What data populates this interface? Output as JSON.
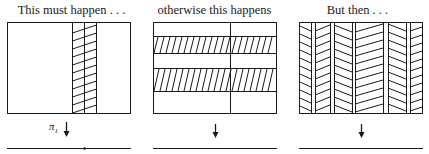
{
  "panels": [
    {
      "caption": "This must happen . . .",
      "projection_label": "π",
      "projection_sub": "1",
      "arrow": "↓",
      "pattern": "single-hatched-vertical-strip"
    },
    {
      "caption": "otherwise this happens",
      "arrow": "↓",
      "pattern": "two-hatched-horizontal-bands"
    },
    {
      "caption": "But then . . .",
      "arrow": "↓",
      "pattern": "chevron-hatched-columns"
    }
  ],
  "colors": {
    "ink": "#1a1a1a",
    "background": "#ffffff"
  }
}
